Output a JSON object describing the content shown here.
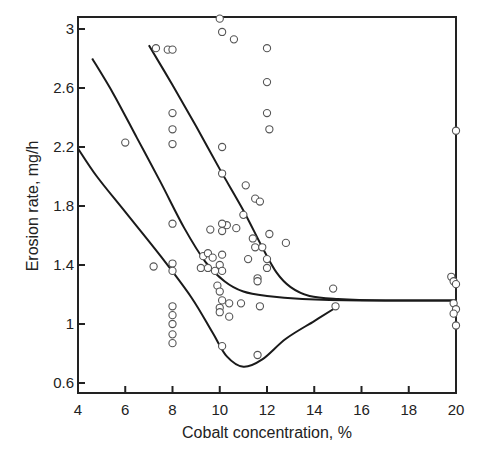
{
  "chart_data": {
    "type": "scatter",
    "title": "",
    "xlabel": "Cobalt concentration, %",
    "ylabel": "Erosion rate, mg/h",
    "xlim": [
      4,
      20
    ],
    "ylim": [
      0.6,
      3.05
    ],
    "xticks": [
      4,
      6,
      8,
      10,
      12,
      14,
      16,
      18,
      20
    ],
    "xtick_labels": [
      "4",
      "6",
      "8",
      "10",
      "12",
      "14",
      "16",
      "18",
      "20"
    ],
    "yticks": [
      0.6,
      1,
      1.4,
      1.8,
      2.2,
      2.6,
      3
    ],
    "ytick_labels": [
      "0.6",
      "1",
      "1.4",
      "1.8",
      "2.2",
      "2.6",
      "3"
    ],
    "grid": false,
    "legend": null,
    "series": [
      {
        "name": "measured points",
        "kind": "scatter",
        "marker": "open-circle",
        "points": [
          [
            6.0,
            2.23
          ],
          [
            7.3,
            2.87
          ],
          [
            7.8,
            2.86
          ],
          [
            8.0,
            2.86
          ],
          [
            8.0,
            2.43
          ],
          [
            8.0,
            2.32
          ],
          [
            8.0,
            2.22
          ],
          [
            7.2,
            1.39
          ],
          [
            8.0,
            1.68
          ],
          [
            8.0,
            1.41
          ],
          [
            8.0,
            1.36
          ],
          [
            8.0,
            1.12
          ],
          [
            8.0,
            1.06
          ],
          [
            8.0,
            1.0
          ],
          [
            8.0,
            0.93
          ],
          [
            8.0,
            0.87
          ],
          [
            10.0,
            3.07
          ],
          [
            10.1,
            2.98
          ],
          [
            10.6,
            2.93
          ],
          [
            12.0,
            2.87
          ],
          [
            12.0,
            2.64
          ],
          [
            12.0,
            2.43
          ],
          [
            12.1,
            2.32
          ],
          [
            10.1,
            2.2
          ],
          [
            10.1,
            2.02
          ],
          [
            11.1,
            1.94
          ],
          [
            11.5,
            1.85
          ],
          [
            11.7,
            1.83
          ],
          [
            11.0,
            1.74
          ],
          [
            10.3,
            1.67
          ],
          [
            10.1,
            1.68
          ],
          [
            10.1,
            1.63
          ],
          [
            9.6,
            1.64
          ],
          [
            10.7,
            1.65
          ],
          [
            12.1,
            1.61
          ],
          [
            12.8,
            1.55
          ],
          [
            11.4,
            1.58
          ],
          [
            11.5,
            1.52
          ],
          [
            11.8,
            1.52
          ],
          [
            11.2,
            1.44
          ],
          [
            12.0,
            1.44
          ],
          [
            9.3,
            1.46
          ],
          [
            9.5,
            1.48
          ],
          [
            9.7,
            1.45
          ],
          [
            10.1,
            1.47
          ],
          [
            9.2,
            1.38
          ],
          [
            9.5,
            1.38
          ],
          [
            9.8,
            1.36
          ],
          [
            10.0,
            1.4
          ],
          [
            10.1,
            1.36
          ],
          [
            11.6,
            1.31
          ],
          [
            11.6,
            1.29
          ],
          [
            12.0,
            1.38
          ],
          [
            9.9,
            1.26
          ],
          [
            10.0,
            1.22
          ],
          [
            10.1,
            1.16
          ],
          [
            10.0,
            1.11
          ],
          [
            10.0,
            1.08
          ],
          [
            10.4,
            1.14
          ],
          [
            10.9,
            1.14
          ],
          [
            11.7,
            1.12
          ],
          [
            10.4,
            1.05
          ],
          [
            10.1,
            0.85
          ],
          [
            11.6,
            0.79
          ],
          [
            14.8,
            1.24
          ],
          [
            14.9,
            1.12
          ],
          [
            20.0,
            2.31
          ],
          [
            19.8,
            1.32
          ],
          [
            19.9,
            1.29
          ],
          [
            20.0,
            1.27
          ],
          [
            19.9,
            1.14
          ],
          [
            20.0,
            1.1
          ],
          [
            19.9,
            1.07
          ],
          [
            20.0,
            0.99
          ]
        ]
      },
      {
        "name": "lower curve",
        "kind": "line",
        "points": [
          [
            4.0,
            2.19
          ],
          [
            4.8,
            2.0
          ],
          [
            6.0,
            1.76
          ],
          [
            7.5,
            1.46
          ],
          [
            8.8,
            1.18
          ],
          [
            9.7,
            0.94
          ],
          [
            10.3,
            0.78
          ],
          [
            11.0,
            0.71
          ],
          [
            11.8,
            0.76
          ],
          [
            12.8,
            0.9
          ],
          [
            14.0,
            1.02
          ],
          [
            14.9,
            1.11
          ]
        ]
      },
      {
        "name": "middle curve",
        "kind": "line",
        "points": [
          [
            4.6,
            2.8
          ],
          [
            5.5,
            2.56
          ],
          [
            6.5,
            2.26
          ],
          [
            7.5,
            1.96
          ],
          [
            8.5,
            1.65
          ],
          [
            9.4,
            1.42
          ],
          [
            10.2,
            1.29
          ],
          [
            11.0,
            1.22
          ],
          [
            12.0,
            1.19
          ],
          [
            13.5,
            1.17
          ],
          [
            16.0,
            1.16
          ],
          [
            20.0,
            1.16
          ]
        ]
      },
      {
        "name": "upper curve",
        "kind": "line",
        "points": [
          [
            7.0,
            2.89
          ],
          [
            8.0,
            2.62
          ],
          [
            9.0,
            2.34
          ],
          [
            10.0,
            2.05
          ],
          [
            11.0,
            1.77
          ],
          [
            11.8,
            1.52
          ],
          [
            12.4,
            1.35
          ],
          [
            13.0,
            1.25
          ],
          [
            13.8,
            1.19
          ],
          [
            15.0,
            1.17
          ],
          [
            17.0,
            1.16
          ],
          [
            20.0,
            1.16
          ]
        ]
      }
    ]
  }
}
